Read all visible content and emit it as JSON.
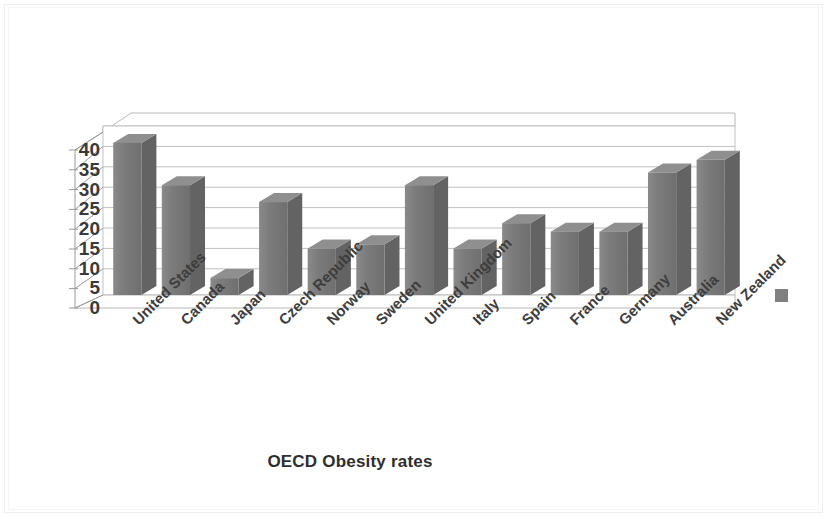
{
  "chart_data": {
    "type": "bar",
    "title": "OECD Obesity rates",
    "xlabel": "",
    "ylabel": "",
    "ylim": [
      0,
      40
    ],
    "ytick_step": 5,
    "yticks": [
      40,
      35,
      30,
      25,
      20,
      15,
      10,
      5,
      0
    ],
    "grid": true,
    "legend_position": "right",
    "style": "3d-column",
    "bar_color": "#7a7a7a",
    "bar_top_color": "#8f8f8f",
    "bar_side_color": "#636363",
    "categories": [
      "United States",
      "Canada",
      "Japan",
      "Czech Republic",
      "Norway",
      "Sweden",
      "United Kingdom",
      "Italy",
      "Spain",
      "France",
      "Germany",
      "Australia",
      "New Zealand"
    ],
    "values": [
      36,
      26,
      4,
      22,
      11,
      12,
      26,
      11,
      17,
      15,
      15,
      29,
      32
    ],
    "series": [
      {
        "name": "Series 1",
        "values": [
          36,
          26,
          4,
          22,
          11,
          12,
          26,
          11,
          17,
          15,
          15,
          29,
          32
        ]
      }
    ]
  },
  "legend": {
    "swatch_color": "#808080",
    "label": ""
  }
}
